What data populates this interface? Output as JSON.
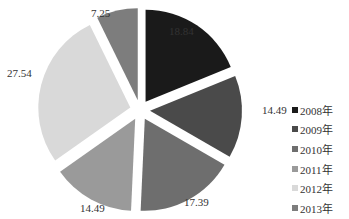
{
  "chart_data": {
    "type": "pie",
    "title": "",
    "exploded": true,
    "start_angle": "12 o'clock, clockwise",
    "categories": [
      "2008年",
      "2009年",
      "2010年",
      "2011年",
      "2012年",
      "2013年"
    ],
    "values": [
      18.84,
      14.49,
      17.39,
      14.49,
      27.54,
      7.25
    ],
    "labels": [
      "18.84",
      "14.49",
      "17.39",
      "14.49",
      "27.54",
      "7.25"
    ],
    "colors": [
      "#1a1a1a",
      "#4a4a4a",
      "#6e6e6e",
      "#9a9a9a",
      "#d9d9d9",
      "#7d7d7d"
    ],
    "legend_position": "right"
  },
  "legend": {
    "items": [
      {
        "label": "2008年",
        "color": "#1a1a1a"
      },
      {
        "label": "2009年",
        "color": "#4a4a4a"
      },
      {
        "label": "2010年",
        "color": "#6e6e6e"
      },
      {
        "label": "2011年",
        "color": "#9a9a9a"
      },
      {
        "label": "2012年",
        "color": "#d9d9d9"
      },
      {
        "label": "2013年",
        "color": "#7d7d7d"
      }
    ]
  }
}
